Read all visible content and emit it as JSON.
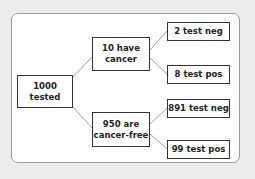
{
  "diagram": {
    "type": "tree",
    "colors": {
      "background": "#ececec",
      "panel": "#ffffff",
      "border": "#333333",
      "link": "#888888"
    },
    "root": {
      "id": "root",
      "label": "1000\ntested"
    },
    "branches": [
      {
        "id": "cancer",
        "label": "10 have\ncancer",
        "children": [
          {
            "id": "cancer-neg",
            "label": "2 test neg"
          },
          {
            "id": "cancer-pos",
            "label": "8 test pos"
          }
        ]
      },
      {
        "id": "free",
        "label": "950 are\ncancer-free",
        "children": [
          {
            "id": "free-neg",
            "label": "891 test neg"
          },
          {
            "id": "free-pos",
            "label": "99 test pos"
          }
        ]
      }
    ]
  }
}
